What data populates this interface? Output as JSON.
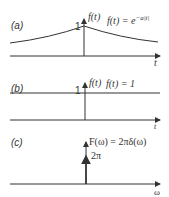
{
  "panels": [
    {
      "id": "a",
      "label": "(a)",
      "axis_label": "f(t)",
      "value_label": "1",
      "equation": "f(t) = e",
      "equation_exponent": "−a|t|",
      "x_axis_label": "t"
    },
    {
      "id": "b",
      "label": "(b)",
      "axis_label": "f(t)",
      "value_label": "1",
      "equation": "f(t) = 1",
      "x_axis_label": "t"
    },
    {
      "id": "c",
      "label": "(c)",
      "equation": "F(ω) = 2πδ(ω)",
      "impulse_label": "2π",
      "x_axis_label": "ω"
    }
  ],
  "colors": {
    "ink": "#333333",
    "background": "#ffffff"
  }
}
